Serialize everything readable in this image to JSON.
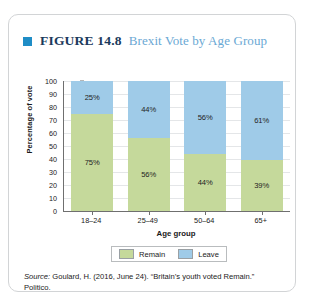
{
  "figure": {
    "bullet_icon": "blue-square-bullet",
    "number_label": "FIGURE 14.8",
    "subtitle": "Brexit Vote by Age Group"
  },
  "source": {
    "label": "Source:",
    "text": " Goulard, H. (2016, June 24). “Britain’s youth voted Remain.” Politico."
  },
  "legend": {
    "items": [
      {
        "label": "Remain",
        "color": "#c5d99b"
      },
      {
        "label": "Leave",
        "color": "#9fcbe8"
      }
    ]
  },
  "chart_data": {
    "type": "bar",
    "title": "Brexit Vote by Age Group",
    "xlabel": "Age group",
    "ylabel": "Percentage of vote",
    "ylim": [
      0,
      100
    ],
    "yticks": [
      100,
      90,
      80,
      70,
      60,
      50,
      40,
      30,
      20,
      10,
      0
    ],
    "grid": true,
    "stacked": true,
    "legend_position": "bottom",
    "categories": [
      "18–24",
      "25–49",
      "50–64",
      "65+"
    ],
    "series": [
      {
        "name": "Remain",
        "color": "#c5d99b",
        "values": [
          75,
          56,
          44,
          39
        ],
        "labels": [
          "75%",
          "56%",
          "44%",
          "39%"
        ]
      },
      {
        "name": "Leave",
        "color": "#9fcbe8",
        "values": [
          25,
          44,
          56,
          61
        ],
        "labels": [
          "25%",
          "44%",
          "56%",
          "61%"
        ]
      }
    ]
  }
}
